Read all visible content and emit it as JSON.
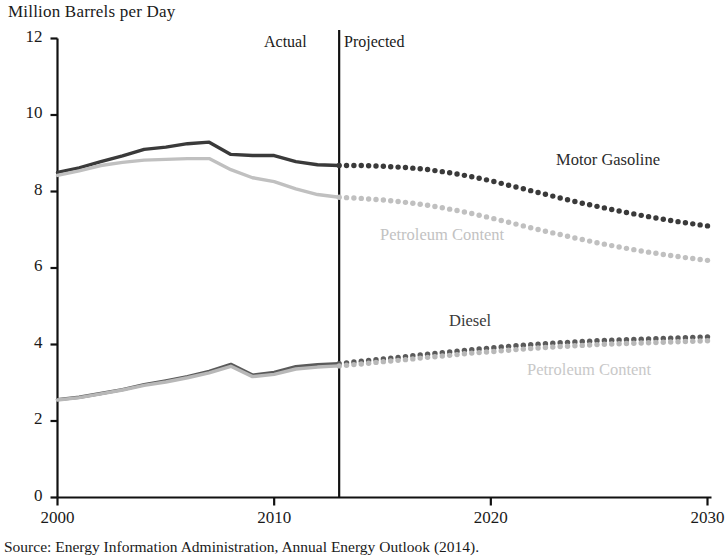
{
  "chart_data": {
    "type": "line",
    "title": "Million Barrels per Day",
    "ylabel": "Million Barrels per Day",
    "xlabel": "",
    "xlim": [
      2000,
      2030
    ],
    "ylim": [
      0,
      12
    ],
    "yticks": [
      0,
      2,
      4,
      6,
      8,
      10,
      12
    ],
    "xticks": [
      2000,
      2010,
      2020,
      2030
    ],
    "grid": false,
    "legend_position": "inline-annotations",
    "annotations": [
      {
        "text": "Actual",
        "x": 2007.9,
        "y": 11.55
      },
      {
        "text": "Projected",
        "x": 2013.6,
        "y": 11.55
      },
      {
        "text": "Motor Gasoline",
        "x": 2023.0,
        "y": 9.0
      },
      {
        "text": "Petroleum Content",
        "x": 2016.0,
        "y": 7.05
      },
      {
        "text": "Diesel",
        "x": 2019.0,
        "y": 4.85
      },
      {
        "text": "Petroleum Content",
        "x": 2021.5,
        "y": 3.6
      }
    ],
    "divider": {
      "x": 2013.0,
      "label_left": "Actual",
      "label_right": "Projected"
    },
    "x": [
      2000,
      2001,
      2002,
      2003,
      2004,
      2005,
      2006,
      2007,
      2008,
      2009,
      2010,
      2011,
      2012,
      2013,
      2014,
      2015,
      2016,
      2017,
      2018,
      2019,
      2020,
      2021,
      2022,
      2023,
      2024,
      2025,
      2026,
      2027,
      2028,
      2029,
      2030
    ],
    "series": [
      {
        "name": "Motor Gasoline",
        "color": "#3a3a3a",
        "style_actual": "solid",
        "style_projected": "dotted",
        "values": [
          8.5,
          8.62,
          8.78,
          8.93,
          9.1,
          9.16,
          9.25,
          9.29,
          8.97,
          8.94,
          8.94,
          8.78,
          8.7,
          8.68,
          8.68,
          8.66,
          8.63,
          8.58,
          8.5,
          8.4,
          8.28,
          8.14,
          8.0,
          7.86,
          7.72,
          7.6,
          7.48,
          7.37,
          7.27,
          7.18,
          7.1
        ]
      },
      {
        "name": "Petroleum Content (Motor Gasoline)",
        "color": "#c0c0c0",
        "style_actual": "solid",
        "style_projected": "dotted",
        "values": [
          8.42,
          8.54,
          8.68,
          8.76,
          8.82,
          8.84,
          8.86,
          8.86,
          8.57,
          8.36,
          8.26,
          8.07,
          7.92,
          7.85,
          7.82,
          7.78,
          7.72,
          7.65,
          7.55,
          7.44,
          7.31,
          7.17,
          7.03,
          6.9,
          6.77,
          6.65,
          6.54,
          6.44,
          6.35,
          6.27,
          6.2
        ]
      },
      {
        "name": "Diesel",
        "color": "#5a5a5a",
        "style_actual": "solid",
        "style_projected": "dotted",
        "values": [
          2.56,
          2.62,
          2.72,
          2.82,
          2.95,
          3.05,
          3.16,
          3.3,
          3.48,
          3.2,
          3.27,
          3.42,
          3.47,
          3.5,
          3.56,
          3.62,
          3.68,
          3.74,
          3.8,
          3.86,
          3.91,
          3.96,
          4.0,
          4.04,
          4.07,
          4.1,
          4.12,
          4.14,
          4.16,
          4.18,
          4.2
        ]
      },
      {
        "name": "Petroleum Content (Diesel)",
        "color": "#b8b8b8",
        "style_actual": "solid",
        "style_projected": "dotted",
        "values": [
          2.55,
          2.61,
          2.71,
          2.81,
          2.93,
          3.02,
          3.13,
          3.26,
          3.43,
          3.16,
          3.22,
          3.36,
          3.41,
          3.44,
          3.49,
          3.55,
          3.6,
          3.66,
          3.71,
          3.77,
          3.81,
          3.86,
          3.9,
          3.94,
          3.97,
          4.0,
          4.02,
          4.04,
          4.06,
          4.08,
          4.1
        ]
      }
    ]
  },
  "axis": {
    "y_tick_labels": [
      "12",
      "10",
      "8",
      "6",
      "4",
      "2",
      "0"
    ],
    "x_tick_labels": [
      "2000",
      "2010",
      "2020",
      "2030"
    ],
    "y_axis_title": "Million Barrels per Day"
  },
  "labels": {
    "actual": "Actual",
    "projected": "Projected",
    "motor_gasoline": "Motor Gasoline",
    "gasoline_petroleum_content": "Petroleum Content",
    "diesel": "Diesel",
    "diesel_petroleum_content": "Petroleum Content"
  },
  "source": {
    "text": "Source: Energy Information Administration, Annual Energy Outlook (2014)."
  }
}
